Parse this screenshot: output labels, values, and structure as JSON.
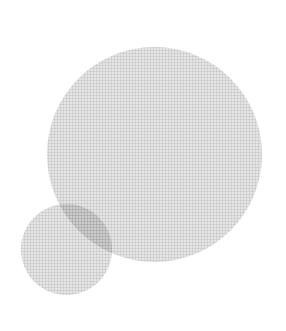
{
  "canvas": {
    "width": 286,
    "height": 331,
    "background_color": "#ffffff",
    "description": "Two overlapping translucent gray circles on a white background with a fine woven canvas texture"
  },
  "palette": {
    "background": "#ffffff",
    "circle_fill": "#d2d2d2",
    "overlap_fill": "#b4b4b4",
    "circle_base": "#a9a9a9",
    "texture_line": "#787878"
  },
  "texture": {
    "name": "woven-canvas-grid",
    "period_px": 3,
    "opacity": 0.42
  },
  "shapes": [
    {
      "name": "large-circle",
      "type": "circle",
      "center_x": 155,
      "center_y": 155,
      "diameter": 215,
      "radius": 107.5,
      "left": 47,
      "top": 47,
      "right": 262,
      "bottom": 263,
      "fill": "#a9a9a9",
      "opacity": 0.3
    },
    {
      "name": "small-circle",
      "type": "circle",
      "center_x": 66,
      "center_y": 249,
      "diameter": 91,
      "radius": 45.5,
      "left": 21,
      "top": 204,
      "right": 112,
      "bottom": 294,
      "fill": "#a9a9a9",
      "opacity": 0.3
    }
  ],
  "overlap": {
    "name": "overlap-lens",
    "fill": "#b4b4b4",
    "note": "Lens-shaped intersection region rendered darker by multiply blending"
  }
}
